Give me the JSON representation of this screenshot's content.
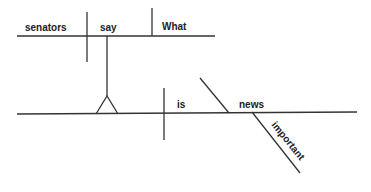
{
  "diagram": {
    "type": "sentence-diagram",
    "sentence": "What senators say is important news",
    "noun_clause": {
      "subject": "senators",
      "verb": "say",
      "object": "What"
    },
    "main_clause": {
      "subject_placeholder": "noun clause (pedestal)",
      "verb": "is",
      "predicate_nominative": "news",
      "modifier": "important"
    }
  },
  "colors": {
    "line": "#333333",
    "text": "#222222",
    "background": "#ffffff"
  }
}
